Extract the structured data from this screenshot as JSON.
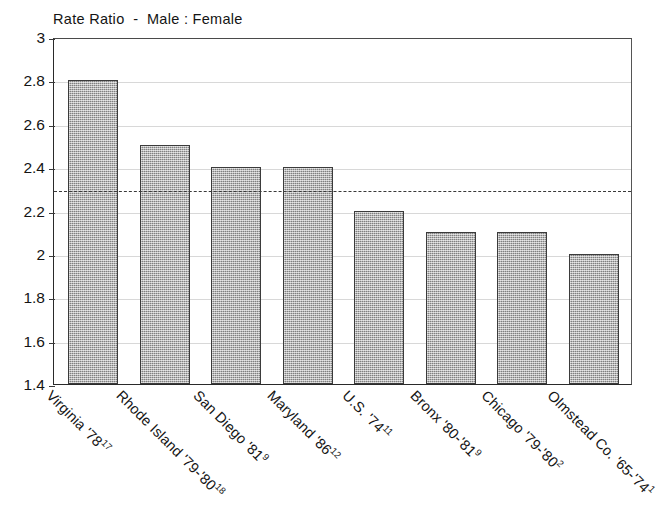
{
  "chart_data": {
    "type": "bar",
    "title": "Rate Ratio  -  Male : Female",
    "xlabel": "",
    "ylabel": "",
    "ylim": [
      1.4,
      3
    ],
    "ytick_step": 0.2,
    "grid": true,
    "legend": "none",
    "orientation": "vertical",
    "bar_fill": "#a3a3a3",
    "bar_border": "#3b3b3b",
    "categories": [
      "Virginia '78",
      "Rhode Island '79-'80",
      "San Diego '81",
      "Maryland '86",
      "U.S. '74",
      "Bronx '80-'81",
      "Chicago '79-'80",
      "Olmstead Co. '65-'74"
    ],
    "category_superscripts": [
      "17",
      "18",
      "9",
      "12",
      "11",
      "9",
      "2",
      "1"
    ],
    "values": [
      2.8,
      2.5,
      2.4,
      2.4,
      2.2,
      2.1,
      2.1,
      2.0
    ],
    "ytick_labels": [
      "3",
      "2.8",
      "2.6",
      "2.4",
      "2.2",
      "2",
      "1.8",
      "1.6",
      "1.4"
    ],
    "ytick_values": [
      3,
      2.8,
      2.6,
      2.4,
      2.2,
      2,
      1.8,
      1.6,
      1.4
    ],
    "reference_line": {
      "value": 2.3,
      "style": "dashed",
      "color": "#3a3a3a"
    }
  }
}
